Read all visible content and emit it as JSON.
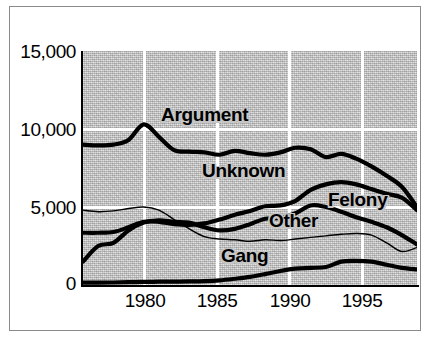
{
  "chart_data": {
    "type": "line",
    "title": "",
    "subtitle": "",
    "xlabel": "",
    "ylabel": "",
    "xlim": [
      1976,
      1998
    ],
    "ylim": [
      0,
      15000
    ],
    "grid": true,
    "grid_color": "#ffffff",
    "plot_background": "#c6c6c6",
    "legend_position": "inline-labels",
    "y_ticks": [
      "0",
      "5,000",
      "10,000",
      "15,000"
    ],
    "y_tick_values": [
      0,
      5000,
      10000,
      15000
    ],
    "x_ticks": [
      "1980",
      "1985",
      "1990",
      "1995"
    ],
    "x_tick_values": [
      1980,
      1985,
      1990,
      1995
    ],
    "x": [
      1976,
      1977,
      1978,
      1979,
      1980,
      1981,
      1982,
      1983,
      1984,
      1985,
      1986,
      1987,
      1988,
      1989,
      1990,
      1991,
      1992,
      1993,
      1994,
      1995,
      1996,
      1997,
      1998
    ],
    "series": [
      {
        "name": "Argument",
        "style": "thick",
        "color": "#000000",
        "values": [
          9000,
          8950,
          9000,
          9300,
          10300,
          9500,
          8650,
          8550,
          8500,
          8350,
          8600,
          8450,
          8350,
          8500,
          8800,
          8700,
          8200,
          8400,
          8100,
          7600,
          7000,
          6300,
          5000
        ]
      },
      {
        "name": "Unknown",
        "style": "thick",
        "color": "#000000",
        "values": [
          3350,
          3350,
          3400,
          3700,
          4050,
          4050,
          3900,
          3850,
          3950,
          4200,
          4500,
          4750,
          5050,
          5100,
          5400,
          6100,
          6450,
          6600,
          6450,
          6150,
          5850,
          5600,
          4800
        ]
      },
      {
        "name": "Felony",
        "style": "thick",
        "color": "#000000",
        "values": [
          1500,
          2500,
          2700,
          3500,
          4000,
          4150,
          4050,
          4000,
          3700,
          3500,
          3600,
          3900,
          4250,
          4300,
          4600,
          5100,
          5000,
          4700,
          4350,
          4050,
          3700,
          3200,
          2600
        ]
      },
      {
        "name": "Other",
        "style": "thin",
        "color": "#000000",
        "values": [
          4800,
          4700,
          4750,
          4900,
          5000,
          4800,
          4200,
          3600,
          3100,
          2950,
          2900,
          2800,
          2900,
          2850,
          2950,
          3050,
          3150,
          3250,
          3300,
          3200,
          2700,
          2150,
          2400
        ]
      },
      {
        "name": "Gang",
        "style": "thick",
        "color": "#000000",
        "values": [
          150,
          150,
          160,
          180,
          200,
          210,
          220,
          230,
          250,
          300,
          400,
          520,
          700,
          900,
          1050,
          1100,
          1150,
          1500,
          1550,
          1500,
          1300,
          1100,
          1000
        ]
      }
    ],
    "annotations": [
      {
        "text": "Argument",
        "x": 1982.6,
        "y": 11050
      },
      {
        "text": "Unknown",
        "x": 1986.0,
        "y": 7450
      },
      {
        "text": "Felony",
        "x": 1994.6,
        "y": 5400
      },
      {
        "text": "Other",
        "x": 1990.2,
        "y": 4250
      },
      {
        "text": "Gang",
        "x": 1988.0,
        "y": 1900
      }
    ]
  }
}
